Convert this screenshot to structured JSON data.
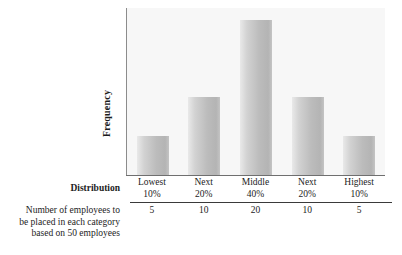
{
  "chart_data": {
    "type": "bar",
    "title": "",
    "xlabel": "Distribution",
    "ylabel": "Frequency",
    "categories": [
      "Lowest 10%",
      "Next 20%",
      "Middle 40%",
      "Next 20%",
      "Highest 10%"
    ],
    "category_lines": [
      {
        "line1": "Lowest",
        "line2": "10%"
      },
      {
        "line1": "Next",
        "line2": "20%"
      },
      {
        "line1": "Middle",
        "line2": "40%"
      },
      {
        "line1": "Next",
        "line2": "20%"
      },
      {
        "line1": "Highest",
        "line2": "10%"
      }
    ],
    "values": [
      5,
      10,
      20,
      10,
      5
    ],
    "value_labels": [
      "5",
      "10",
      "20",
      "10",
      "5"
    ],
    "ylim": [
      0,
      20
    ],
    "grid": false,
    "legend": "none",
    "bar_color": "#bcbcbc",
    "plot_background": "#f7f7f7",
    "axis_color": "#6f6f6f"
  },
  "axis": {
    "y_title": "Frequency",
    "x_row_label": "Distribution"
  },
  "caption": {
    "line1": "Number of employees to",
    "line2": "be placed in each category",
    "line3": "based on 50 employees"
  }
}
